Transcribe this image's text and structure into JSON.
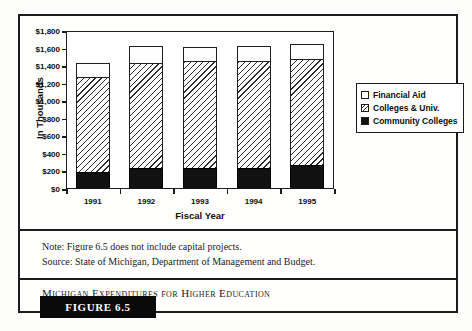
{
  "figure": {
    "tag_label": "FIGURE 6.5",
    "caption": "Michigan Expenditures for Higher Education",
    "note": "Note: Figure 6.5 does not include capital projects.",
    "source": "Source: State of Michigan, Department of Management and Budget."
  },
  "legend": {
    "items": [
      {
        "label": "Financial Aid",
        "swatch": "white-square-icon"
      },
      {
        "label": "Colleges & Univ.",
        "swatch": "hatched-square-icon"
      },
      {
        "label": "Community Colleges",
        "swatch": "black-square-icon"
      }
    ]
  },
  "axes": {
    "y_title": "In Thousands",
    "x_title": "Fiscal Year",
    "y_ticks": [
      "$0",
      "$200",
      "$400",
      "$600",
      "$800",
      "$1,000",
      "$1,200",
      "$1,400",
      "$1,600",
      "$1,800"
    ],
    "x_ticks": [
      "1991",
      "1992",
      "1993",
      "1994",
      "1995"
    ]
  },
  "colors": {
    "frame": "#1c1c1c",
    "community_colleges": "#111111",
    "colleges_univ_hatch": "#2b2b2b",
    "financial_aid": "#ffffff",
    "tag_background": "#0a0a0a"
  },
  "chart_data": {
    "type": "bar",
    "subtype": "stacked",
    "title": "Michigan Expenditures for Higher Education",
    "xlabel": "Fiscal Year",
    "ylabel": "In Thousands",
    "ylim": [
      0,
      1800
    ],
    "ytick_values": [
      0,
      200,
      400,
      600,
      800,
      1000,
      1200,
      1400,
      1600,
      1800
    ],
    "ytick_labels": [
      "$0",
      "$200",
      "$400",
      "$600",
      "$800",
      "$1,000",
      "$1,200",
      "$1,400",
      "$1,600",
      "$1,800"
    ],
    "grid": false,
    "legend_position": "right",
    "categories": [
      "1991",
      "1992",
      "1993",
      "1994",
      "1995"
    ],
    "series": [
      {
        "name": "Community Colleges",
        "values": [
          195,
          240,
          245,
          245,
          275
        ]
      },
      {
        "name": "Colleges & Univ.",
        "values": [
          1085,
          1190,
          1210,
          1210,
          1205
        ]
      },
      {
        "name": "Financial Aid",
        "values": [
          160,
          195,
          160,
          170,
          170
        ]
      }
    ],
    "totals": [
      1440,
      1625,
      1615,
      1625,
      1650
    ],
    "units": "thousands of dollars"
  }
}
